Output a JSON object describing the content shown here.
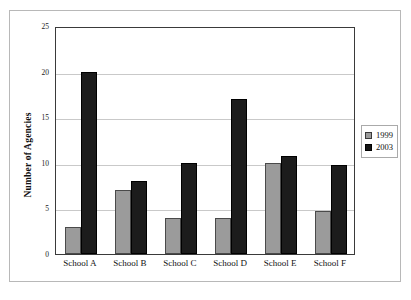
{
  "chart_data": {
    "type": "bar",
    "title": "",
    "xlabel": "",
    "ylabel": "Number of Agencies",
    "ylim": [
      0,
      25
    ],
    "yticks": [
      0,
      5,
      10,
      15,
      20,
      25
    ],
    "grid": true,
    "legend_position": "right-outside",
    "categories": [
      "School A",
      "School B",
      "School C",
      "School D",
      "School E",
      "School F"
    ],
    "series": [
      {
        "name": "1999",
        "color": "#9b9b9b",
        "values": [
          3,
          7,
          4,
          4,
          10,
          4.7
        ]
      },
      {
        "name": "2003",
        "color": "#1c1c1c",
        "values": [
          20,
          8,
          10,
          17,
          10.7,
          9.8
        ]
      }
    ]
  },
  "legend": {
    "entries": [
      {
        "label": "1999",
        "swatch": "gray-square-icon"
      },
      {
        "label": "2003",
        "swatch": "black-square-icon"
      }
    ]
  }
}
